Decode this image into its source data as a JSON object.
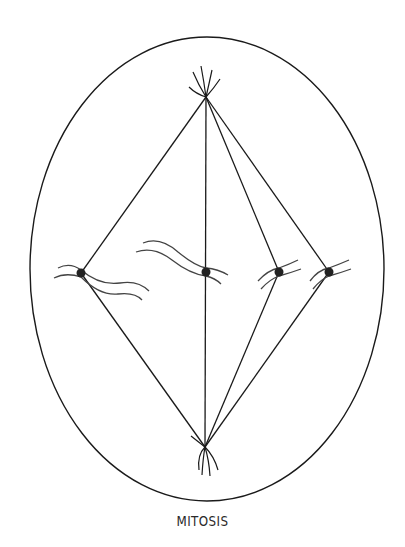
{
  "title": "MITOSIS",
  "colors": {
    "stroke": "#1a1a1a",
    "chromosome": "#444444",
    "centromere": "#222222",
    "background": "#ffffff"
  },
  "cell": {
    "cx": 207,
    "cy": 269,
    "rx": 177,
    "ry": 232
  },
  "poles": [
    {
      "name": "top-centrosome",
      "x": 206,
      "y": 97
    },
    {
      "name": "bottom-centrosome",
      "x": 205,
      "y": 447
    }
  ],
  "chromosomes": [
    {
      "name": "chromosome-1",
      "x": 81,
      "y": 273
    },
    {
      "name": "chromosome-2",
      "x": 206,
      "y": 272
    },
    {
      "name": "chromosome-3",
      "x": 279,
      "y": 272
    },
    {
      "name": "chromosome-4",
      "x": 329,
      "y": 272
    }
  ]
}
